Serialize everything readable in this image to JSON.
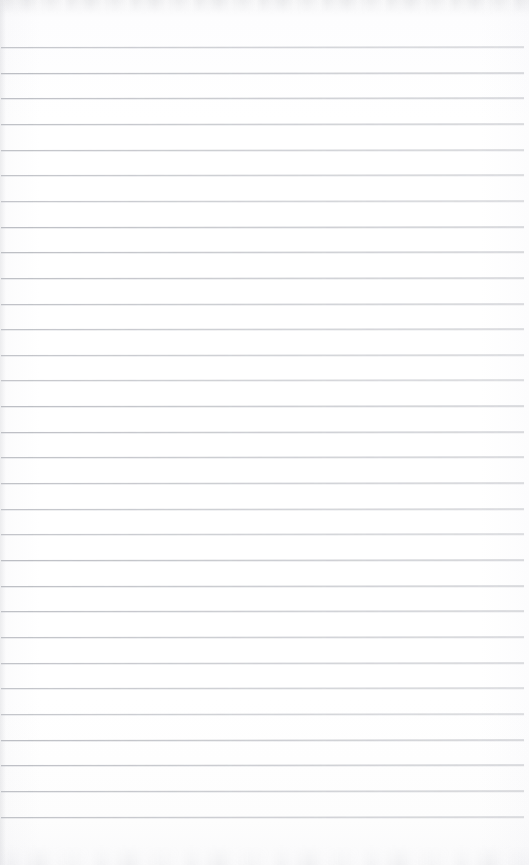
{
  "document": {
    "kind": "scanned-blank-ruled-notepad-page",
    "title": "Blank lined notepad page",
    "page_width": 529,
    "page_height": 865,
    "paper_color": "#fdfdfe",
    "has_text_content": false,
    "has_handwriting": false,
    "has_margin_rule": false,
    "has_header": false,
    "has_footer": false,
    "has_page_number": false,
    "has_holes_or_binding": false,
    "orientation": "portrait",
    "notes_text": ""
  },
  "ruling": {
    "line_color": "#b9bbc1",
    "line_thickness_px": 1,
    "line_count": 31,
    "first_line_y": 47,
    "line_spacing_px": 25.65,
    "line_start_x": 1,
    "line_end_x": 524,
    "line_tilt_deg": -0.06,
    "top_margin_px": 47,
    "bottom_margin_px": 50
  },
  "scan_artifacts": {
    "top_noise_band_height": 14,
    "bottom_noise_band_height": 20,
    "left_edge_shadow_width": 6,
    "noise_color": "#b0b2b8"
  }
}
